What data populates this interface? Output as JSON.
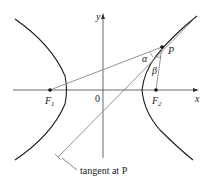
{
  "figure": {
    "axes": {
      "x_label": "x",
      "y_label": "y",
      "origin_label": "0"
    },
    "points": {
      "F1": {
        "label": "F",
        "subscript": "1"
      },
      "F2": {
        "label": "F",
        "subscript": "2"
      },
      "P": {
        "label": "P"
      }
    },
    "angles": {
      "alpha": "α",
      "beta": "β"
    },
    "annotation": "tangent at P",
    "colors": {
      "curve": "#1a1a1a",
      "lines": "#777777",
      "axes": "#333333"
    }
  }
}
